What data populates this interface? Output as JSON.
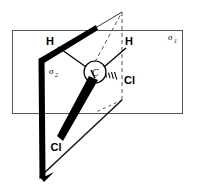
{
  "figure": {
    "kind": "chemical-structure-diagram",
    "background_color": "#ffffff",
    "line_color": "#000000",
    "plane_edge_color": "#555555",
    "width": 199,
    "height": 191
  },
  "planes": [
    {
      "id": "sigma-1",
      "symbol": "σ",
      "subscript": "1",
      "orientation": "horizontal",
      "shape": "rectangle",
      "label_x": 170,
      "label_y": 39
    },
    {
      "id": "sigma-2",
      "symbol": "σ",
      "subscript": "2",
      "orientation": "vertical",
      "shape": "parallelogram",
      "label_x": 52,
      "label_y": 73
    }
  ],
  "center_atom": {
    "symbol": "C",
    "x": 95,
    "y": 72,
    "circled": true,
    "circle_radius": 11
  },
  "atoms": [
    {
      "id": "hydrogen-left",
      "symbol": "H",
      "x": 50,
      "y": 45,
      "bond_style": "plain-line"
    },
    {
      "id": "hydrogen-right",
      "symbol": "H",
      "x": 129,
      "y": 45,
      "bond_style": "plain-line"
    },
    {
      "id": "chlorine-right",
      "symbol": "Cl",
      "x": 123,
      "y": 81,
      "bond_style": "hashed-wedge"
    },
    {
      "id": "chlorine-bottom",
      "symbol": "Cl",
      "x": 56,
      "y": 147,
      "bond_style": "bold-wedge"
    }
  ],
  "bonds": [
    {
      "from": "C",
      "to": "hydrogen-left",
      "style": "bold-taper"
    },
    {
      "from": "C",
      "to": "hydrogen-right",
      "style": "plain-line"
    },
    {
      "from": "C",
      "to": "chlorine-right",
      "style": "hashed-wedge"
    },
    {
      "from": "C",
      "to": "chlorine-bottom",
      "style": "bold-wedge"
    }
  ]
}
